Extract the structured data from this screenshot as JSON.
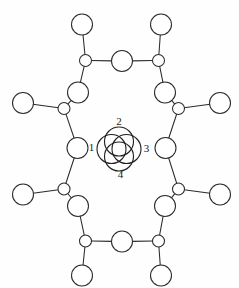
{
  "figure": {
    "background_color": "#fefefe",
    "stroke_color": "#2b2b2b",
    "atom_fill_color": "#ffffff",
    "width": 239,
    "height": 288
  },
  "core": {
    "center": {
      "x": 119,
      "y": 149
    },
    "circle_radius": 14.5,
    "offset": 7.5,
    "circles": [
      {
        "id": "core-circle-1",
        "cx": 111.5,
        "cy": 149.0
      },
      {
        "id": "core-circle-2",
        "cx": 119.0,
        "cy": 141.5
      },
      {
        "id": "core-circle-3",
        "cx": 126.5,
        "cy": 149.0
      },
      {
        "id": "core-circle-4",
        "cx": 119.0,
        "cy": 156.5
      }
    ],
    "labels": [
      {
        "text": "1",
        "x": 91.5,
        "y": 148.5
      },
      {
        "text": "2",
        "x": 119.0,
        "y": 122.5
      },
      {
        "text": "3",
        "x": 146.5,
        "y": 149.0
      },
      {
        "text": "4",
        "x": 120.5,
        "y": 175.5
      }
    ]
  },
  "atoms": [
    {
      "id": "a-top-left-terminal",
      "x": 82.0,
      "y": 24.5,
      "r": 10.5,
      "kind": "large"
    },
    {
      "id": "a-top-right-terminal",
      "x": 161.0,
      "y": 24.5,
      "r": 10.5,
      "kind": "large"
    },
    {
      "id": "a-top-left-junction",
      "x": 85.5,
      "y": 60.5,
      "r": 6.0,
      "kind": "small"
    },
    {
      "id": "a-top-center",
      "x": 122.0,
      "y": 61.0,
      "r": 10.5,
      "kind": "large"
    },
    {
      "id": "a-top-right-junction",
      "x": 158.5,
      "y": 60.5,
      "r": 6.0,
      "kind": "small"
    },
    {
      "id": "a-upper-left-large",
      "x": 78.0,
      "y": 92.5,
      "r": 10.5,
      "kind": "large"
    },
    {
      "id": "a-upper-right-large",
      "x": 165.0,
      "y": 92.5,
      "r": 10.5,
      "kind": "large"
    },
    {
      "id": "a-left-upper-junction",
      "x": 64.0,
      "y": 108.5,
      "r": 6.0,
      "kind": "small"
    },
    {
      "id": "a-right-upper-junction",
      "x": 178.5,
      "y": 108.5,
      "r": 6.0,
      "kind": "small"
    },
    {
      "id": "a-left-upper-terminal",
      "x": 23.0,
      "y": 103.0,
      "r": 10.5,
      "kind": "large"
    },
    {
      "id": "a-right-upper-terminal",
      "x": 220.0,
      "y": 103.0,
      "r": 10.5,
      "kind": "large"
    },
    {
      "id": "a-left-middle-large",
      "x": 77.5,
      "y": 148.0,
      "r": 10.5,
      "kind": "large"
    },
    {
      "id": "a-right-middle-large",
      "x": 165.5,
      "y": 148.0,
      "r": 10.5,
      "kind": "large"
    },
    {
      "id": "a-left-lower-junction",
      "x": 64.0,
      "y": 189.0,
      "r": 6.0,
      "kind": "small"
    },
    {
      "id": "a-right-lower-junction",
      "x": 178.5,
      "y": 189.0,
      "r": 6.0,
      "kind": "small"
    },
    {
      "id": "a-left-lower-terminal",
      "x": 23.0,
      "y": 194.5,
      "r": 10.5,
      "kind": "large"
    },
    {
      "id": "a-right-lower-terminal",
      "x": 220.0,
      "y": 194.5,
      "r": 10.5,
      "kind": "large"
    },
    {
      "id": "a-lower-left-large",
      "x": 78.0,
      "y": 206.0,
      "r": 10.5,
      "kind": "large"
    },
    {
      "id": "a-lower-right-large",
      "x": 165.0,
      "y": 206.0,
      "r": 10.5,
      "kind": "large"
    },
    {
      "id": "a-bottom-left-junction",
      "x": 85.5,
      "y": 241.0,
      "r": 6.0,
      "kind": "small"
    },
    {
      "id": "a-bottom-center",
      "x": 122.0,
      "y": 241.5,
      "r": 10.5,
      "kind": "large"
    },
    {
      "id": "a-bottom-right-junction",
      "x": 158.5,
      "y": 241.0,
      "r": 6.0,
      "kind": "small"
    },
    {
      "id": "a-bottom-left-terminal",
      "x": 82.0,
      "y": 275.5,
      "r": 10.5,
      "kind": "large"
    },
    {
      "id": "a-bottom-right-terminal",
      "x": 161.0,
      "y": 275.5,
      "r": 10.5,
      "kind": "large"
    }
  ],
  "bonds": [
    {
      "id": "b-1",
      "from": "a-top-left-terminal",
      "to": "a-top-left-junction"
    },
    {
      "id": "b-2",
      "from": "a-top-left-junction",
      "to": "a-top-center"
    },
    {
      "id": "b-3",
      "from": "a-top-center",
      "to": "a-top-right-junction"
    },
    {
      "id": "b-4",
      "from": "a-top-right-junction",
      "to": "a-top-right-terminal"
    },
    {
      "id": "b-5",
      "from": "a-top-left-junction",
      "to": "a-upper-left-large"
    },
    {
      "id": "b-6",
      "from": "a-top-right-junction",
      "to": "a-upper-right-large"
    },
    {
      "id": "b-7",
      "from": "a-upper-left-large",
      "to": "a-left-upper-junction"
    },
    {
      "id": "b-8",
      "from": "a-upper-right-large",
      "to": "a-right-upper-junction"
    },
    {
      "id": "b-9",
      "from": "a-left-upper-junction",
      "to": "a-left-upper-terminal"
    },
    {
      "id": "b-10",
      "from": "a-right-upper-junction",
      "to": "a-right-upper-terminal"
    },
    {
      "id": "b-11",
      "from": "a-left-upper-junction",
      "to": "a-left-middle-large"
    },
    {
      "id": "b-12",
      "from": "a-right-upper-junction",
      "to": "a-right-middle-large"
    },
    {
      "id": "b-13",
      "from": "a-left-middle-large",
      "to": "a-left-lower-junction"
    },
    {
      "id": "b-14",
      "from": "a-right-middle-large",
      "to": "a-right-lower-junction"
    },
    {
      "id": "b-15",
      "from": "a-left-lower-junction",
      "to": "a-left-lower-terminal"
    },
    {
      "id": "b-16",
      "from": "a-right-lower-junction",
      "to": "a-right-lower-terminal"
    },
    {
      "id": "b-17",
      "from": "a-left-lower-junction",
      "to": "a-lower-left-large"
    },
    {
      "id": "b-18",
      "from": "a-right-lower-junction",
      "to": "a-lower-right-large"
    },
    {
      "id": "b-19",
      "from": "a-lower-left-large",
      "to": "a-bottom-left-junction"
    },
    {
      "id": "b-20",
      "from": "a-lower-right-large",
      "to": "a-bottom-right-junction"
    },
    {
      "id": "b-21",
      "from": "a-bottom-left-junction",
      "to": "a-bottom-center"
    },
    {
      "id": "b-22",
      "from": "a-bottom-center",
      "to": "a-bottom-right-junction"
    },
    {
      "id": "b-23",
      "from": "a-bottom-left-junction",
      "to": "a-bottom-left-terminal"
    },
    {
      "id": "b-24",
      "from": "a-bottom-right-junction",
      "to": "a-bottom-right-terminal"
    }
  ]
}
